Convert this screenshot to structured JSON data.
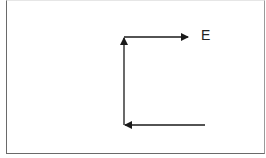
{
  "diagram": {
    "type": "vector-path",
    "label": "E",
    "stroke_color": "#1a1a1a",
    "segments": [
      {
        "name": "bottom-arrow",
        "from": [
          205,
          125
        ],
        "to": [
          124,
          125
        ],
        "arrowhead": "end"
      },
      {
        "name": "vertical-arrow",
        "from": [
          124,
          125
        ],
        "to": [
          124,
          37
        ],
        "arrowhead": "end"
      },
      {
        "name": "top-arrow",
        "from": [
          124,
          37
        ],
        "to": [
          188,
          37
        ],
        "arrowhead": "end"
      }
    ]
  }
}
